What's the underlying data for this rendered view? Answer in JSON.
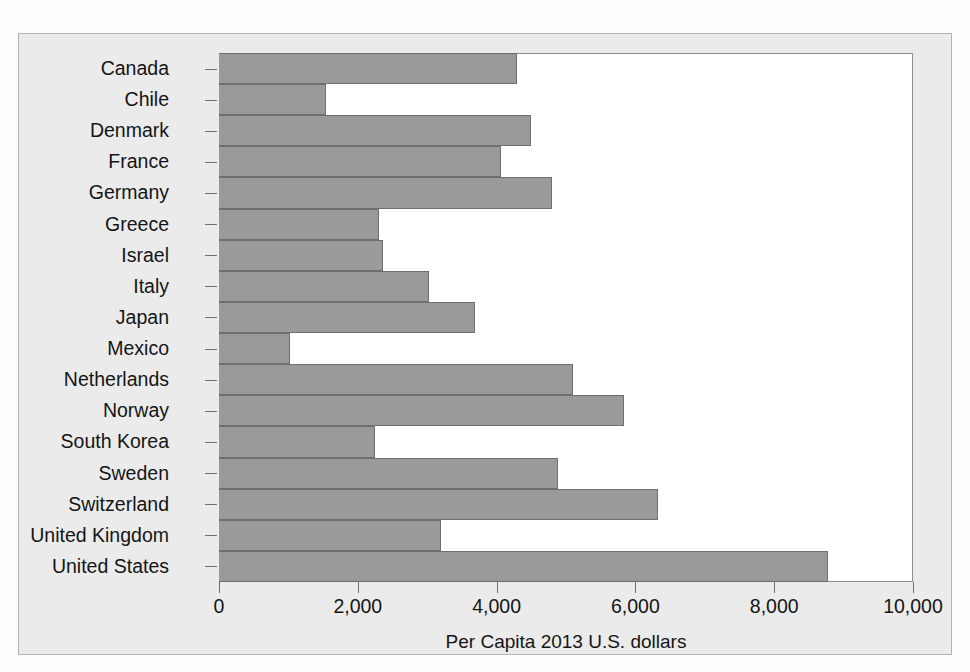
{
  "chart_data": {
    "type": "bar",
    "orientation": "horizontal",
    "title": "",
    "xlabel": "Per Capita 2013 U.S. dollars",
    "ylabel": "",
    "xlim": [
      0,
      10000
    ],
    "xticks": [
      0,
      2000,
      4000,
      6000,
      8000,
      10000
    ],
    "xtick_labels": [
      "0",
      "2,000",
      "4,000",
      "6,000",
      "8,000",
      "10,000"
    ],
    "grid": false,
    "legend": false,
    "bar_color": "#9a9a9a",
    "bar_edge_color": "#6f6f6f",
    "plot_background": "#ffffff",
    "figure_background": "#ebebeb",
    "categories": [
      "Canada",
      "Chile",
      "Denmark",
      "France",
      "Germany",
      "Greece",
      "Israel",
      "Italy",
      "Japan",
      "Mexico",
      "Netherlands",
      "Norway",
      "South Korea",
      "Sweden",
      "Switzerland",
      "United Kingdom",
      "United States"
    ],
    "values": [
      4300,
      1540,
      4500,
      4070,
      4800,
      2300,
      2370,
      3020,
      3690,
      1020,
      5100,
      5840,
      2250,
      4890,
      6330,
      3200,
      8770
    ]
  }
}
